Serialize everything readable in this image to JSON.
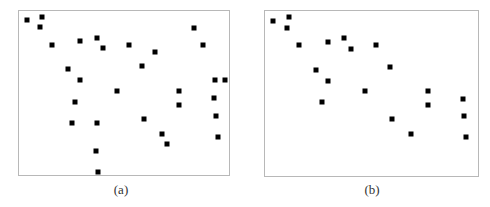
{
  "figure": {
    "marker_color": "#000000",
    "frame_color": "#b8b8b8",
    "panels": [
      {
        "id": "a",
        "caption": "(a)",
        "frame": {
          "left": 18,
          "top": 10,
          "width": 212,
          "height": 166
        },
        "caption_pos": {
          "x": 121,
          "y": 190
        },
        "points": [
          [
            7.7,
            9
          ],
          [
            23,
            5.7
          ],
          [
            21,
            16.3
          ],
          [
            32.7,
            33.7
          ],
          [
            61.3,
            30.3
          ],
          [
            77.7,
            27
          ],
          [
            84.3,
            37.3
          ],
          [
            109.7,
            33.7
          ],
          [
            49.3,
            58.3
          ],
          [
            61.3,
            69
          ],
          [
            97.7,
            80
          ],
          [
            56.3,
            90.7
          ],
          [
            52.7,
            111.7
          ],
          [
            77.7,
            111.7
          ],
          [
            77.3,
            140
          ],
          [
            79.3,
            161
          ],
          [
            175.3,
            16.7
          ],
          [
            184,
            34.3
          ],
          [
            136.3,
            41.3
          ],
          [
            123,
            55.3
          ],
          [
            195.7,
            69.3
          ],
          [
            206,
            69.3
          ],
          [
            160.3,
            80
          ],
          [
            160.3,
            94
          ],
          [
            124.7,
            108
          ],
          [
            195.3,
            87.3
          ],
          [
            197.3,
            105
          ],
          [
            199,
            126
          ],
          [
            143,
            122.7
          ],
          [
            148.3,
            133
          ]
        ]
      },
      {
        "id": "b",
        "caption": "(b)",
        "frame": {
          "left": 264,
          "top": 10,
          "width": 215,
          "height": 167
        },
        "caption_pos": {
          "x": 372,
          "y": 190
        },
        "points": [
          [
            8,
            9.7
          ],
          [
            23.7,
            6.3
          ],
          [
            22,
            17
          ],
          [
            34,
            34.3
          ],
          [
            62.7,
            31
          ],
          [
            79.3,
            27.3
          ],
          [
            86.3,
            37.7
          ],
          [
            111.3,
            34.3
          ],
          [
            51,
            59
          ],
          [
            62.7,
            69.7
          ],
          [
            99.7,
            80.3
          ],
          [
            57.3,
            91
          ],
          [
            125.3,
            56
          ],
          [
            162.7,
            80.3
          ],
          [
            162.7,
            94.3
          ],
          [
            127.3,
            108.3
          ],
          [
            197.7,
            87.7
          ],
          [
            199.3,
            105
          ],
          [
            201,
            126.3
          ],
          [
            146,
            123
          ]
        ]
      }
    ]
  }
}
